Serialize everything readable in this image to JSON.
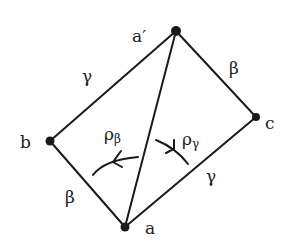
{
  "diagram": {
    "type": "graph",
    "colors": {
      "ink": "#1a1a1a",
      "background": "#ffffff"
    },
    "vertices": [
      {
        "id": "a_prime",
        "label": "a′",
        "x": 176,
        "y": 31,
        "lx": 132,
        "ly": 42
      },
      {
        "id": "b",
        "label": "b",
        "x": 50,
        "y": 141,
        "lx": 20,
        "ly": 148
      },
      {
        "id": "c",
        "label": "c",
        "x": 256,
        "y": 117,
        "lx": 265,
        "ly": 129
      },
      {
        "id": "a",
        "label": "a",
        "x": 125,
        "y": 227,
        "lx": 145,
        "ly": 234
      }
    ],
    "edges": [
      {
        "from": "a_prime",
        "to": "b",
        "label": "γ",
        "lx": 82,
        "ly": 82
      },
      {
        "from": "a_prime",
        "to": "c",
        "label": "β",
        "lx": 229,
        "ly": 74
      },
      {
        "from": "b",
        "to": "a",
        "label": "β",
        "lx": 65,
        "ly": 203
      },
      {
        "from": "c",
        "to": "a",
        "label": "γ",
        "lx": 206,
        "ly": 182
      },
      {
        "from": "a_prime",
        "to": "a",
        "label": ""
      }
    ],
    "rotations": [
      {
        "label": "ρ",
        "sub": "β",
        "lx": 104,
        "ly": 140
      },
      {
        "label": "ρ",
        "sub": "γ",
        "lx": 182,
        "ly": 145
      }
    ]
  }
}
